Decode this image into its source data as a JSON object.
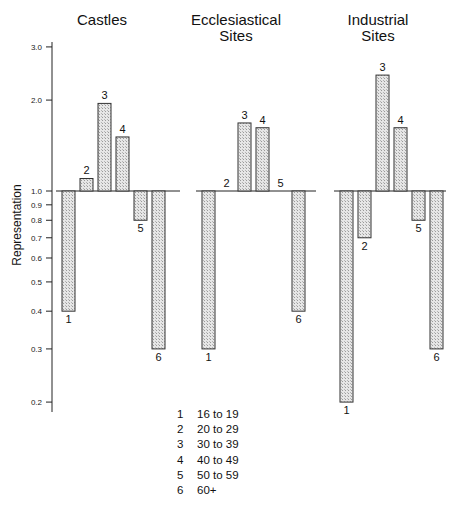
{
  "chart_data": {
    "type": "bar",
    "scale": "log",
    "baseline": 1.0,
    "ylabel": "Representation",
    "yticks": [
      0.2,
      0.3,
      0.4,
      0.5,
      0.6,
      0.7,
      0.8,
      0.9,
      1.0,
      2.0,
      3.0
    ],
    "ytick_labels": [
      "0.2",
      "0.3",
      "0.4",
      "0.5",
      "0.6",
      "0.7",
      "0.8",
      "0.9",
      "1.0",
      "2.0",
      "3.0"
    ],
    "ylim": [
      0.19,
      3.1
    ],
    "categories": [
      "1",
      "2",
      "3",
      "4",
      "5",
      "6"
    ],
    "series": [
      {
        "name": "Castles",
        "title_lines": [
          "Castles"
        ],
        "values": [
          0.4,
          1.1,
          1.95,
          1.51,
          0.8,
          0.3
        ]
      },
      {
        "name": "Ecclesiastical Sites",
        "title_lines": [
          "Ecclesiastical",
          "Sites"
        ],
        "values": [
          0.3,
          1.0,
          1.68,
          1.62,
          1.0,
          0.4
        ]
      },
      {
        "name": "Industrial Sites",
        "title_lines": [
          "Industrial",
          "Sites"
        ],
        "values": [
          0.2,
          0.7,
          2.42,
          1.62,
          0.8,
          0.3
        ]
      }
    ],
    "legend": [
      {
        "num": "1",
        "label": "16 to 19"
      },
      {
        "num": "2",
        "label": "20 to 29"
      },
      {
        "num": "3",
        "label": "30 to 39"
      },
      {
        "num": "4",
        "label": "40 to 49"
      },
      {
        "num": "5",
        "label": "50 to 59"
      },
      {
        "num": "6",
        "label": "60+"
      }
    ],
    "legend_position": "bottom-center",
    "grid": false
  }
}
